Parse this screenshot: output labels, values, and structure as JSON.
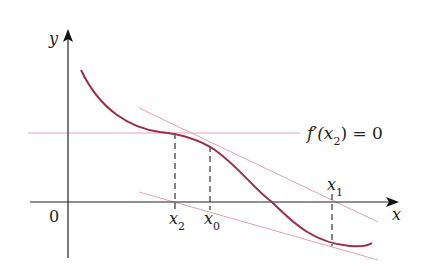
{
  "figure": {
    "colors": {
      "curve": "#9b2f4a",
      "tangent": "#e8a0b0",
      "axis": "#222222",
      "dashed": "#333333"
    },
    "axes": {
      "x_label": "x",
      "y_label": "y",
      "origin_label": "0"
    },
    "points": [
      {
        "name": "x2",
        "label": "x",
        "subscript": "2"
      },
      {
        "name": "x0",
        "label": "x",
        "subscript": "0"
      },
      {
        "name": "x1",
        "label": "x",
        "subscript": "1"
      }
    ],
    "annotation": {
      "pre": "f′(x",
      "sub": "2",
      "post": ") = 0"
    }
  }
}
